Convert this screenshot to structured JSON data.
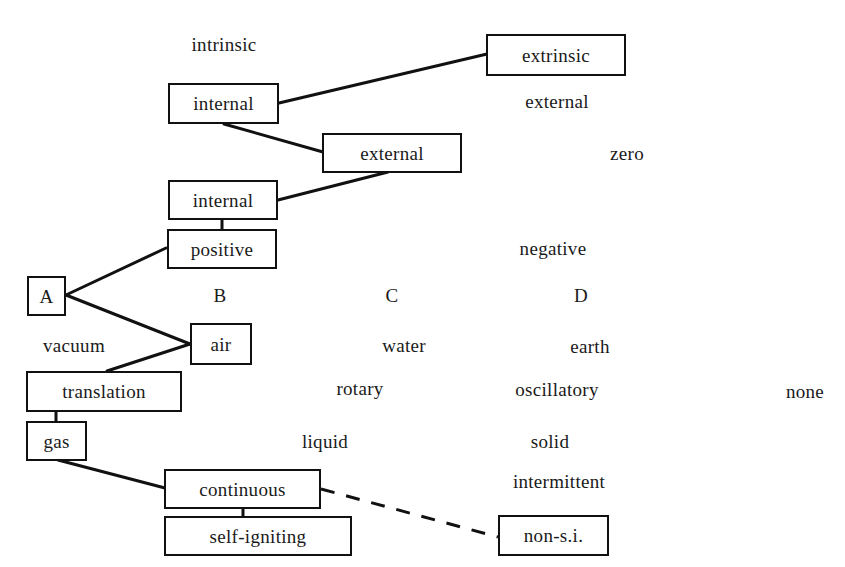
{
  "diagram": {
    "type": "morphological-box / selection path",
    "colors": {
      "ink": "#111111",
      "background": "#ffffff"
    },
    "column_headers": {
      "A": "A",
      "B": "B",
      "C": "C",
      "D": "D"
    },
    "rows": [
      {
        "selected": "internal",
        "alternatives": [
          "intrinsic",
          "extrinsic"
        ],
        "selected_right": "extrinsic"
      },
      {
        "selected": "external",
        "alternatives": [
          "internal",
          "external"
        ]
      },
      {
        "selected": "internal",
        "alternatives": [
          "zero"
        ]
      },
      {
        "selected": "positive",
        "alternatives": [
          "negative"
        ]
      },
      {
        "selected": "air",
        "alternatives": [
          "vacuum",
          "water",
          "earth"
        ]
      },
      {
        "selected": "translation",
        "alternatives": [
          "rotary",
          "oscillatory",
          "none"
        ]
      },
      {
        "selected": "gas",
        "alternatives": [
          "liquid",
          "solid"
        ]
      },
      {
        "selected": "continuous",
        "alternatives": [
          "intermittent"
        ]
      },
      {
        "selected": "self-igniting",
        "alternatives": [
          "non-s.i."
        ],
        "dashed_link_to": "non-s.i."
      }
    ],
    "nodes": {
      "extrinsic": "extrinsic",
      "internal_1": "internal",
      "external_box": "external",
      "internal_2": "internal",
      "positive": "positive",
      "A": "A",
      "air": "air",
      "translation": "translation",
      "gas": "gas",
      "continuous": "continuous",
      "self_igniting": "self-igniting",
      "non_si": "non-s.i."
    },
    "labels": {
      "intrinsic": "intrinsic",
      "external_text": "external",
      "zero": "zero",
      "negative": "negative",
      "B": "B",
      "C": "C",
      "D": "D",
      "vacuum": "vacuum",
      "water": "water",
      "earth": "earth",
      "rotary": "rotary",
      "oscillatory": "oscillatory",
      "none": "none",
      "liquid": "liquid",
      "solid": "solid",
      "intermittent": "intermittent"
    }
  }
}
